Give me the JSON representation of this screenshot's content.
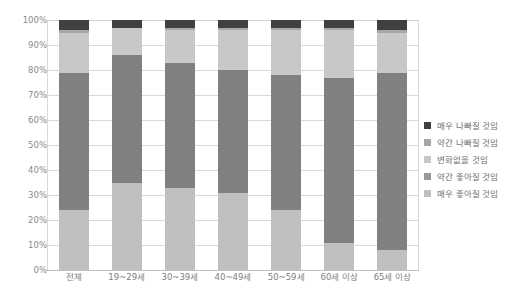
{
  "chart_data": {
    "type": "bar",
    "subtype": "stacked-bar-100-percent",
    "title": "",
    "xlabel": "",
    "ylabel": "",
    "ylim": [
      0,
      100
    ],
    "ytick_labels": [
      "100%",
      "90%",
      "80%",
      "70%",
      "60%",
      "50%",
      "40%",
      "30%",
      "20%",
      "10%",
      "0%"
    ],
    "ytick_values": [
      100,
      90,
      80,
      70,
      60,
      50,
      40,
      30,
      20,
      10,
      0
    ],
    "grid": true,
    "legend_position": "right",
    "categories": [
      "전체",
      "19~29세",
      "30~39세",
      "40~49세",
      "50~59세",
      "60세 이상",
      "65세 이상"
    ],
    "series": [
      {
        "name": "매우 좋아질 것임",
        "color": "#bfbfbf",
        "values": [
          24,
          35,
          33,
          31,
          24,
          11,
          8
        ]
      },
      {
        "name": "약간 좋아질 것임",
        "color": "#808080",
        "values": [
          55,
          51,
          50,
          49,
          54,
          66,
          71
        ]
      },
      {
        "name": "변화없을 것임",
        "color": "#c8c8c8",
        "values": [
          16,
          11,
          13,
          16,
          18,
          19,
          16
        ]
      },
      {
        "name": "약간 나빠질 것임",
        "color": "#a6a6a6",
        "values": [
          1,
          0,
          1,
          1,
          1,
          1,
          1
        ]
      },
      {
        "name": "매우 나빠질 것임",
        "color": "#404040",
        "values": [
          4,
          3,
          3,
          3,
          3,
          3,
          4
        ]
      }
    ],
    "legend_entries": [
      "매우 나빠질 것임",
      "약간 나빠질 것임",
      "변화없을 것임",
      "약간 좋아질 것임",
      "매우 좋아질 것임"
    ],
    "legend_colors": [
      "#404040",
      "#a6a6a6",
      "#c8c8c8",
      "#9a9a9a",
      "#bfbfbf"
    ]
  }
}
